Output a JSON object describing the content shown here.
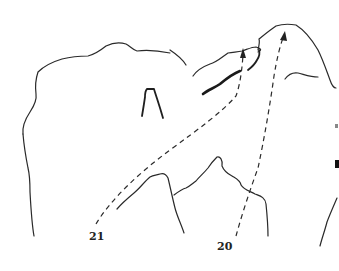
{
  "figure": {
    "labels": [
      {
        "id": "label-21",
        "text": "21"
      },
      {
        "id": "label-20",
        "text": "20"
      }
    ],
    "colors": {
      "line": "#2a2a2a",
      "background": "#ffffff"
    }
  }
}
